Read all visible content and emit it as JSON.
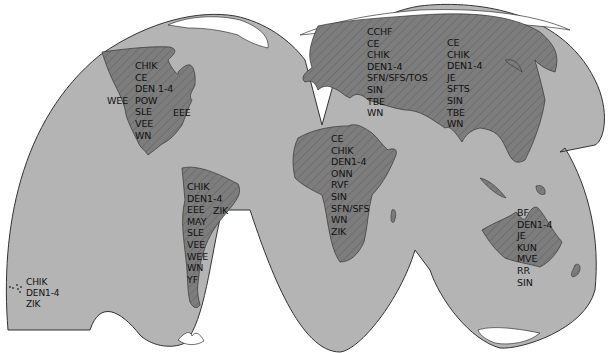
{
  "map": {
    "type": "interrupted world map (arbovirus distribution)",
    "colors": {
      "ocean_lobe": "#b4b4b4",
      "land": "#7d7d7d",
      "outline": "#333333",
      "ice": "#ffffff",
      "background": "#ffffff"
    },
    "regions": {
      "north_america": {
        "labels": [
          "CHIK",
          "CE",
          "DEN 1-4",
          "POW",
          "SLE",
          "VEE",
          "WN"
        ],
        "west_label": "WEE",
        "east_label": "EEE"
      },
      "south_america": {
        "labels": [
          "CHIK",
          "DEN1-4",
          "EEE",
          "MAY",
          "SLE",
          "VEE",
          "WEE",
          "WN",
          "YF"
        ],
        "east_label": "ZIK"
      },
      "pacific_islands": {
        "labels": [
          "CHIK",
          "DEN1-4",
          "ZIK"
        ]
      },
      "europe_west_asia": {
        "labels": [
          "CCHF",
          "CE",
          "CHIK",
          "DEN1-4",
          "SFN/SFS/TOS",
          "SIN",
          "TBE",
          "WN"
        ]
      },
      "east_asia": {
        "labels": [
          "CE",
          "CHIK",
          "DEN1-4",
          "JE",
          "SFTS",
          "SIN",
          "TBE",
          "WN"
        ]
      },
      "africa": {
        "labels": [
          "CE",
          "CHIK",
          "DEN1-4",
          "ONN",
          "RVF",
          "SIN",
          "SFN/SFS",
          "WN",
          "ZIK"
        ]
      },
      "australia": {
        "labels": [
          "BF",
          "DEN1-4",
          "JE",
          "KUN",
          "MVE",
          "RR",
          "SIN"
        ]
      }
    }
  }
}
